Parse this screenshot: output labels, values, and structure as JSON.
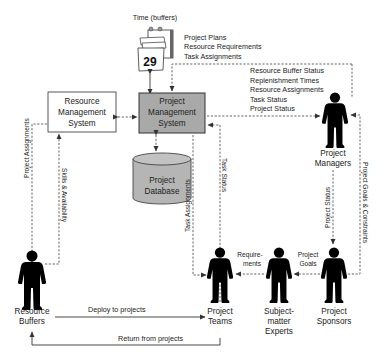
{
  "diagram": {
    "calendar": {
      "title": "Time (buffers)",
      "day": "29"
    },
    "calendar_outputs": [
      "Project Plans",
      "Resource Requirements",
      "Task Assignments"
    ],
    "nodes": {
      "rms": [
        "Resource",
        "Management",
        "System"
      ],
      "pms": [
        "Project",
        "Management",
        "System"
      ],
      "db": [
        "Project",
        "Database"
      ],
      "managers": [
        "Project",
        "Managers"
      ],
      "buffers": [
        "Resource",
        "Buffers"
      ],
      "teams": [
        "Project",
        "Teams"
      ],
      "experts": [
        "Subject-",
        "matter",
        "Experts"
      ],
      "sponsors": [
        "Project",
        "Sponsors"
      ]
    },
    "pms_to_managers": [
      "Resource Buffer Status",
      "Replenishment Times",
      "Resource Assignments",
      "Task Status",
      "Project Status"
    ],
    "edge_labels": {
      "project_assignments": "Project Assignments",
      "skills_availability": "Skills & Availability",
      "task_assignments": "Task Assignments",
      "task_status": "Task Status",
      "project_status": "Project Status",
      "project_goals_constraints": "Project Goals & Constraints",
      "requirements": [
        "Require-",
        "ments"
      ],
      "project_goals": [
        "Project",
        "Goals"
      ],
      "deploy": "Deploy to projects",
      "return": "Return from projects"
    },
    "colors": {
      "pms_fill": "#a9a9a9",
      "db_fill": "#b5b5b5",
      "person": "#000000"
    }
  }
}
